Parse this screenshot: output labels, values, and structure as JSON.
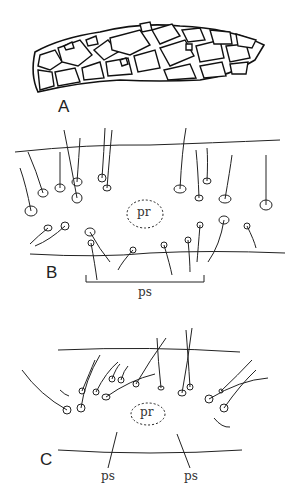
{
  "figure": {
    "panels": [
      {
        "id": "A",
        "label": "A",
        "description": "case made of stone fragments"
      },
      {
        "id": "B",
        "label": "B",
        "annotations": {
          "center": "pr",
          "bracket": "ps"
        }
      },
      {
        "id": "C",
        "label": "C",
        "annotations": {
          "center": "pr",
          "arrows": [
            "ps",
            "ps"
          ]
        }
      }
    ]
  },
  "colors": {
    "ink": "#1a1a1a",
    "background": "#ffffff"
  }
}
